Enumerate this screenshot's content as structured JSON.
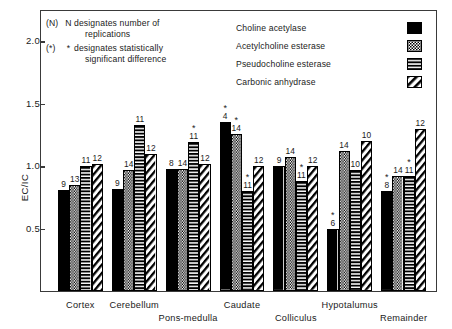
{
  "chart_data": {
    "type": "bar",
    "title": "",
    "xlabel": "",
    "ylabel": "EC/IC",
    "ylim": [
      0,
      2.25
    ],
    "yticks": [
      "0.5",
      "1.0",
      "1.5",
      "2.0"
    ],
    "ytick_values": [
      0.5,
      1.0,
      1.5,
      2.0
    ],
    "grid": false,
    "legend_position": "inside-top-right",
    "categories": [
      "Cortex",
      "Cerebellum",
      "Pons-medulla",
      "Caudate",
      "Colliculus",
      "Hypotalumus",
      "Remainder"
    ],
    "series": [
      {
        "name": "Choline acetylase",
        "pattern": "solid-black",
        "values": [
          0.81,
          0.82,
          0.98,
          1.35,
          1.0,
          0.5,
          0.8
        ],
        "replications": [
          "9",
          "9",
          "8",
          "4",
          "9",
          "6",
          "8"
        ],
        "significant": [
          false,
          false,
          false,
          true,
          false,
          true,
          true
        ]
      },
      {
        "name": "Acetylcholine esterase",
        "pattern": "checker",
        "values": [
          0.85,
          0.97,
          0.98,
          1.26,
          1.07,
          1.12,
          0.92
        ],
        "replications": [
          "13",
          "14",
          "14",
          "14",
          "14",
          "14",
          "14"
        ],
        "significant": [
          false,
          false,
          false,
          true,
          false,
          false,
          false
        ]
      },
      {
        "name": "Pseudocholine esterase",
        "pattern": "horizontal-stripes",
        "values": [
          1.0,
          1.33,
          1.19,
          0.8,
          0.88,
          0.97,
          0.92
        ],
        "replications": [
          "11",
          "11",
          "11",
          "11",
          "11",
          "10",
          "11"
        ],
        "significant": [
          false,
          false,
          true,
          true,
          true,
          false,
          true
        ]
      },
      {
        "name": "Carbonic anhydrase",
        "pattern": "diagonal-hatch",
        "values": [
          1.02,
          1.1,
          1.02,
          1.0,
          1.0,
          1.2,
          1.3
        ],
        "replications": [
          "12",
          "12",
          "12",
          "12",
          "12",
          "10",
          "12"
        ],
        "significant": [
          false,
          false,
          false,
          false,
          false,
          false,
          false
        ]
      }
    ]
  },
  "notes": [
    {
      "key": "(N)",
      "symbol": "N",
      "line1": "designates number of",
      "line2": "replications"
    },
    {
      "key": "(*)",
      "symbol": "*",
      "line1": "designates statistically",
      "line2": "significant difference"
    }
  ],
  "axis": {
    "y_title": "EC/IC"
  },
  "colors": {
    "ink": "#1a1a1a",
    "frame": "#3a3a3a",
    "bar_fill": "#000000",
    "background": "#ffffff"
  }
}
